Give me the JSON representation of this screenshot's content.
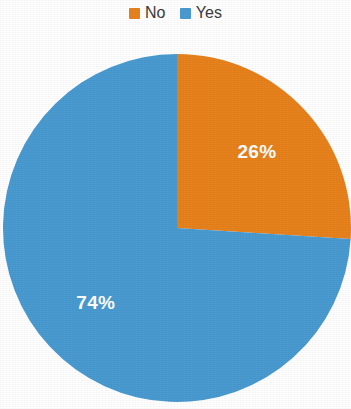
{
  "legend": {
    "position": "top-center",
    "items": [
      {
        "label": "No",
        "color": "#E8821E",
        "swatch_icon": "legend-swatch-square"
      },
      {
        "label": "Yes",
        "color": "#4A9BD1",
        "swatch_icon": "legend-swatch-square"
      }
    ]
  },
  "slices": [
    {
      "label": "No",
      "percent_label": "26%",
      "value": 26,
      "color": "#E8821E"
    },
    {
      "label": "Yes",
      "percent_label": "74%",
      "value": 74,
      "color": "#4A9BD1"
    }
  ],
  "chart_data": {
    "type": "pie",
    "title": "",
    "xlabel": "",
    "ylabel": "",
    "categories": [
      "No",
      "Yes"
    ],
    "values": [
      26,
      74
    ],
    "value_unit": "percent",
    "data_labels": [
      "26%",
      "74%"
    ],
    "colors": [
      "#E8821E",
      "#4A9BD1"
    ],
    "legend": [
      "No",
      "Yes"
    ],
    "legend_position": "top",
    "grid": false,
    "start_angle_deg": 0,
    "direction": "clockwise",
    "series": [
      {
        "name": "share",
        "values": [
          26,
          74
        ]
      }
    ]
  },
  "geometry": {
    "center_x": 177,
    "center_y": 228,
    "radius": 174
  }
}
